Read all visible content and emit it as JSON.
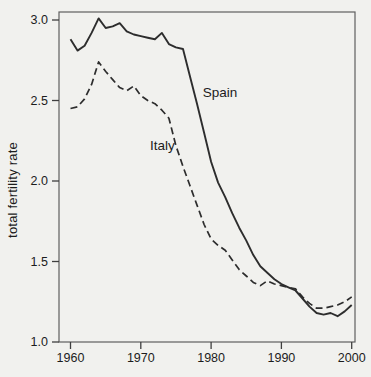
{
  "figure": {
    "kind": "scanned line chart",
    "background_color": "#f1f1ee",
    "line_color": "#2d2d2d",
    "border_color": "#5f5f5f",
    "text_color": "#1c1c1c"
  },
  "chart_data": {
    "type": "line",
    "title": "",
    "xlabel": "",
    "ylabel": "total fertility rate",
    "grid": false,
    "legend": "inline labels next to lines",
    "xlim": [
      1958.4,
      2000.5
    ],
    "ylim": [
      1.0,
      3.05
    ],
    "x_ticks": [
      1960,
      1970,
      1980,
      1990,
      2000
    ],
    "x_tick_labels": [
      "1960",
      "1970",
      "1980",
      "1990",
      "2000"
    ],
    "y_ticks": [
      1.0,
      1.5,
      2.0,
      2.5,
      3.0
    ],
    "y_tick_labels": [
      "1.0",
      "1.5",
      "2.0",
      "2.5",
      "3.0"
    ],
    "x": [
      1960,
      1961,
      1962,
      1963,
      1964,
      1965,
      1966,
      1967,
      1968,
      1969,
      1970,
      1971,
      1972,
      1973,
      1974,
      1975,
      1976,
      1977,
      1978,
      1979,
      1980,
      1981,
      1982,
      1983,
      1984,
      1985,
      1986,
      1987,
      1988,
      1989,
      1990,
      1991,
      1992,
      1993,
      1994,
      1995,
      1996,
      1997,
      1998,
      1999,
      2000
    ],
    "series": [
      {
        "name": "Spain",
        "line_style": "solid",
        "label_anchor": {
          "year": 1978.8,
          "value": 2.52
        },
        "values": [
          2.88,
          2.81,
          2.84,
          2.92,
          3.01,
          2.95,
          2.96,
          2.98,
          2.93,
          2.91,
          2.9,
          2.89,
          2.88,
          2.92,
          2.85,
          2.83,
          2.82,
          2.65,
          2.48,
          2.3,
          2.12,
          1.99,
          1.9,
          1.8,
          1.71,
          1.63,
          1.54,
          1.47,
          1.43,
          1.39,
          1.36,
          1.34,
          1.32,
          1.27,
          1.22,
          1.18,
          1.17,
          1.18,
          1.16,
          1.19,
          1.23
        ]
      },
      {
        "name": "Italy",
        "line_style": "dashed",
        "label_anchor": {
          "year": 1971.3,
          "value": 2.19
        },
        "values": [
          2.45,
          2.46,
          2.51,
          2.6,
          2.74,
          2.68,
          2.63,
          2.58,
          2.56,
          2.59,
          2.53,
          2.5,
          2.48,
          2.44,
          2.39,
          2.22,
          2.09,
          1.97,
          1.85,
          1.73,
          1.64,
          1.6,
          1.57,
          1.51,
          1.45,
          1.41,
          1.37,
          1.35,
          1.38,
          1.36,
          1.35,
          1.34,
          1.33,
          1.28,
          1.24,
          1.21,
          1.21,
          1.22,
          1.23,
          1.25,
          1.28
        ]
      }
    ]
  }
}
